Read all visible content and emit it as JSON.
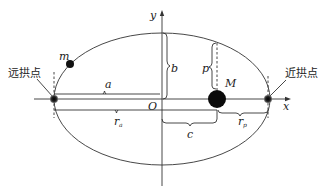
{
  "diagram": {
    "type": "elliptical-orbit",
    "axes": {
      "x_label": "x",
      "y_label": "y",
      "origin_label": "O"
    },
    "points": {
      "aphelion_label": "远拱点",
      "perihelion_label": "近拱点",
      "central_body_label": "M",
      "orbiting_body_label": "m"
    },
    "segments": {
      "semi_major": "a",
      "semi_minor": "b",
      "focal_distance": "c",
      "semi_latus_rectum": "p",
      "aphelion_distance": "r",
      "aphelion_sub": "a",
      "perihelion_distance": "r",
      "perihelion_sub": "p"
    },
    "colors": {
      "line": "#333333",
      "body": "#111111",
      "background": "#ffffff"
    }
  }
}
